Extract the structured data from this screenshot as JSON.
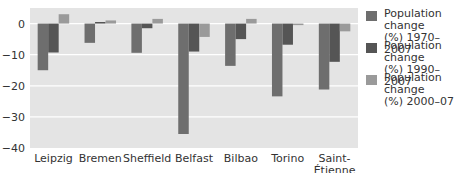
{
  "chart_data": {
    "type": "bar",
    "title": "",
    "xlabel": "",
    "ylabel": "",
    "ylim": [
      -40,
      5
    ],
    "yticks": [
      0,
      -10,
      -20,
      -30,
      -40
    ],
    "grid": true,
    "legend_position": "right",
    "categories": [
      "Leipzig",
      "Bremen",
      "Sheffield",
      "Belfast",
      "Bilbao",
      "Torino",
      "Saint-Étienne"
    ],
    "series": [
      {
        "name": "Population change (%) 1970–2007",
        "color": "#6e6e6e",
        "values": [
          -15.0,
          -6.2,
          -9.4,
          -35.5,
          -13.6,
          -23.4,
          -21.2
        ]
      },
      {
        "name": "Population change (%) 1990–2007",
        "color": "#555555",
        "values": [
          -9.3,
          0.5,
          -1.5,
          -9.0,
          -5.0,
          -6.8,
          -12.3
        ]
      },
      {
        "name": "Population change (%) 2000–07",
        "color": "#9a9a9a",
        "values": [
          3.0,
          1.0,
          1.5,
          -4.3,
          1.5,
          -0.5,
          -2.5
        ]
      }
    ]
  },
  "legend": [
    {
      "line1": "Population change",
      "line2": "(%) 1970–2007"
    },
    {
      "line1": "Population change",
      "line2": "(%) 1990–2007"
    },
    {
      "line1": "Population change",
      "line2": "(%) 2000–07"
    }
  ],
  "colors": {
    "plot_bg": "#e4e4e4",
    "grid": "#ffffff",
    "text": "#333333"
  }
}
